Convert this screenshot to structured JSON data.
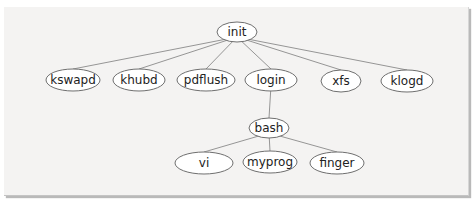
{
  "diagram": {
    "type": "process-tree",
    "nodes": [
      {
        "id": "init",
        "label": "init",
        "cx": 237,
        "cy": 32,
        "rx": 20,
        "ry": 10,
        "parent": null
      },
      {
        "id": "kswapd",
        "label": "kswapd",
        "cx": 73,
        "cy": 80,
        "rx": 27,
        "ry": 11,
        "parent": "init"
      },
      {
        "id": "khubd",
        "label": "khubd",
        "cx": 139,
        "cy": 80,
        "rx": 26,
        "ry": 11,
        "parent": "init"
      },
      {
        "id": "pdflush",
        "label": "pdflush",
        "cx": 206,
        "cy": 80,
        "rx": 29,
        "ry": 11,
        "parent": "init"
      },
      {
        "id": "login",
        "label": "login",
        "cx": 271,
        "cy": 80,
        "rx": 26,
        "ry": 11,
        "parent": "init"
      },
      {
        "id": "xfs",
        "label": "xfs",
        "cx": 341,
        "cy": 81,
        "rx": 20,
        "ry": 11,
        "parent": "init"
      },
      {
        "id": "klogd",
        "label": "klogd",
        "cx": 407,
        "cy": 81,
        "rx": 26,
        "ry": 11,
        "parent": "init"
      },
      {
        "id": "bash",
        "label": "bash",
        "cx": 269,
        "cy": 128,
        "rx": 20,
        "ry": 10,
        "parent": "login"
      },
      {
        "id": "vi",
        "label": "vi",
        "cx": 204,
        "cy": 163,
        "rx": 29,
        "ry": 11,
        "parent": "bash"
      },
      {
        "id": "myprog",
        "label": "myprog",
        "cx": 270,
        "cy": 162,
        "rx": 27,
        "ry": 11,
        "parent": "bash"
      },
      {
        "id": "finger",
        "label": "finger",
        "cx": 337,
        "cy": 163,
        "rx": 27,
        "ry": 11,
        "parent": "bash"
      }
    ]
  }
}
